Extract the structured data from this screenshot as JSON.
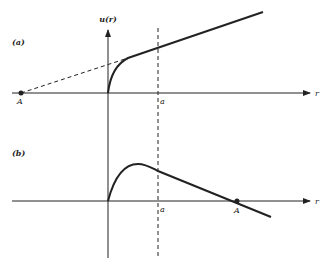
{
  "figure": {
    "panels": [
      {
        "id": "a",
        "tag": "(a)",
        "y_axis_label": "u(r)",
        "x_axis_label": "r",
        "tick_a_label": "a",
        "point_label": "A",
        "description": "u(r) rises steeply from origin, then linear beyond; dashed extrapolation back to intercept A on negative r axis"
      },
      {
        "id": "b",
        "tag": "(b)",
        "x_axis_label": "r",
        "tick_a_label": "a",
        "point_label": "A",
        "description": "u(r) rises to a maximum inside r<a, then decreases linearly, crossing the r axis at A > a"
      }
    ],
    "colors": {
      "ink": "#222222",
      "background": "#ffffff"
    }
  }
}
